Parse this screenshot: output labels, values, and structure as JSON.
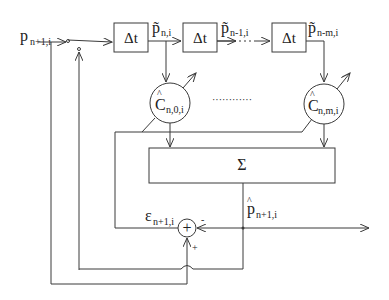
{
  "diagram": {
    "input": {
      "symbol": "p",
      "subscript": "n+1,i"
    },
    "delay_blocks": [
      {
        "label": "Δt"
      },
      {
        "label": "Δt"
      },
      {
        "label": "Δt"
      }
    ],
    "delayed_signals": [
      {
        "symbol": "p̃",
        "subscript": "n,i"
      },
      {
        "symbol": "p̃",
        "subscript": "n-1,i"
      },
      {
        "symbol": "p̃",
        "subscript": "n-m,i"
      }
    ],
    "coefficients": [
      {
        "hat": "^",
        "symbol": "C",
        "subscript": "n,0,i"
      },
      {
        "hat": "^",
        "symbol": "C",
        "subscript": "n,m,i"
      }
    ],
    "ellipsis": "············",
    "summer": {
      "label": "Σ"
    },
    "prediction": {
      "hat": "^",
      "symbol": "p",
      "subscript": "n+1,i"
    },
    "error": {
      "symbol": "ε",
      "subscript": "n+1,i"
    },
    "adder": {
      "label": "+",
      "minus_sign": "-",
      "plus_sign": "+"
    },
    "colors": {
      "line": "#3a3a3a",
      "text": "#222222",
      "background": "#ffffff"
    }
  }
}
